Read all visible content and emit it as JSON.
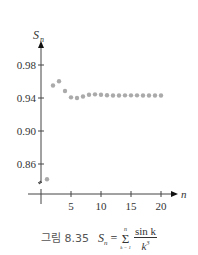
{
  "chart_data": {
    "type": "scatter",
    "title": "",
    "xlabel": "n",
    "ylabel": "S_n",
    "x": [
      1,
      2,
      3,
      4,
      5,
      6,
      7,
      8,
      9,
      10,
      11,
      12,
      13,
      14,
      15,
      16,
      17,
      18,
      19,
      20
    ],
    "values": [
      0.8415,
      0.9551,
      0.9603,
      0.9485,
      0.9408,
      0.94,
      0.9419,
      0.9439,
      0.9444,
      0.9439,
      0.9433,
      0.943,
      0.9431,
      0.9432,
      0.9432,
      0.9432,
      0.9431,
      0.9431,
      0.9431,
      0.9431
    ],
    "xticks": [
      "5",
      "10",
      "15",
      "20"
    ],
    "yticks": [
      "0.86",
      "0.90",
      "0.94",
      "0.98"
    ],
    "xlim": [
      0,
      21
    ],
    "ylim": [
      0.84,
      1.0
    ],
    "grid": false,
    "axis_break": true,
    "point_color": "#aaaaaa"
  },
  "axes": {
    "y_label": "S",
    "y_label_sub": "n",
    "x_label": "n",
    "yticks": [
      {
        "label": "0.98"
      },
      {
        "label": "0.94"
      },
      {
        "label": "0.90"
      },
      {
        "label": "0.86"
      }
    ],
    "xticks": [
      {
        "label": "5"
      },
      {
        "label": "10"
      },
      {
        "label": "15"
      },
      {
        "label": "20"
      }
    ]
  },
  "caption": {
    "label": "그림 8.35",
    "formula_lhs": "S",
    "formula_sub": "n",
    "formula_eq": " = ",
    "sum_top": "n",
    "sum_bottom": "k = 1",
    "numerator": "sin k",
    "denominator": "k",
    "denominator_exp": "3"
  }
}
